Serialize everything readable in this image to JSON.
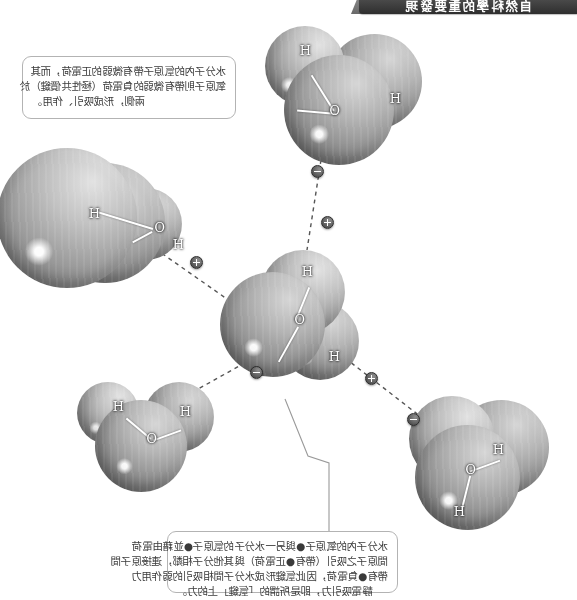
{
  "figure": {
    "banner_title": "自然科學的重要發現",
    "background_color": "#ffffff",
    "banner_color": "#3a3a3a"
  },
  "captions": {
    "top": {
      "name": "polar-bond-note",
      "lines": [
        "水分子內的氫原子帶有微弱的正電荷，而其",
        "氧原子則帶有微弱的負電荷（極性共價鍵）於",
        "兩側，形成吸引、作用。"
      ]
    },
    "bottom": {
      "name": "hydrogen-bond-note",
      "lines": [
        "水分子內的氧原子●與另一水分子的氫原子●並藉由電荷",
        "間原子之吸引（帶有●正電荷）與其他分子相鄰，連接原子間",
        "帶有●負電荷，因此氫鍵形成水分子間相吸引的弱作用力",
        "靜電吸引力，即是所謂的「氫鍵」上的力。"
      ]
    }
  },
  "molecules": [
    {
      "name": "water-molecule-top-left",
      "atoms": [
        "H",
        "O",
        "H"
      ],
      "position": "top-left"
    },
    {
      "name": "water-molecule-center",
      "atoms": [
        "H",
        "O",
        "H"
      ],
      "position": "center"
    },
    {
      "name": "water-molecule-right",
      "atoms": [
        "H",
        "O",
        "H"
      ],
      "position": "right"
    },
    {
      "name": "water-molecule-bottom-left",
      "atoms": [
        "H",
        "O",
        "H"
      ],
      "position": "bottom-left"
    },
    {
      "name": "water-molecule-bottom-right",
      "atoms": [
        "H",
        "O",
        "H"
      ],
      "position": "bottom-right"
    }
  ],
  "atom_labels": {
    "hydrogen": "H",
    "oxygen": "O"
  },
  "charges": [
    {
      "name": "delta-negative-top",
      "symbol": "−"
    },
    {
      "name": "delta-positive-top",
      "symbol": "+"
    },
    {
      "name": "delta-positive-right",
      "symbol": "+"
    },
    {
      "name": "delta-negative-center-right",
      "symbol": "−"
    },
    {
      "name": "delta-positive-left",
      "symbol": "+"
    },
    {
      "name": "delta-negative-bottom-left",
      "symbol": "−"
    }
  ]
}
